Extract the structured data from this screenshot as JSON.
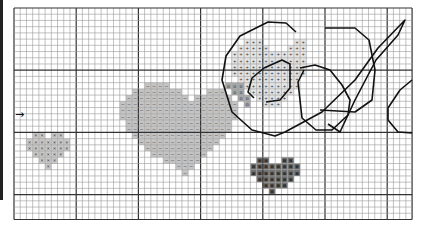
{
  "pattern": {
    "title": "cross-stitch chart",
    "grid": {
      "origin_x": 14,
      "origin_y": 8,
      "cell": 6.22,
      "cols": 64,
      "rows": 34,
      "major_every": 10,
      "minor_color": "#9a9a9a",
      "major_color": "#333333"
    },
    "start_marker": {
      "symbol": "→",
      "row": 17
    },
    "regions": [
      {
        "name": "small-x-heart",
        "symbol": "×",
        "fill": "#c8c8c8",
        "rows": [
          [
            20,
            [
              3,
              4,
              6,
              7
            ]
          ],
          [
            21,
            [
              2,
              3,
              4,
              5,
              6,
              7,
              8
            ]
          ],
          [
            22,
            [
              2,
              3,
              4,
              5,
              6,
              7,
              8
            ]
          ],
          [
            23,
            [
              3,
              4,
              5,
              6,
              7
            ]
          ],
          [
            24,
            [
              4,
              5,
              6
            ]
          ],
          [
            25,
            [
              5
            ]
          ]
        ]
      },
      {
        "name": "large-dash-heart",
        "symbol": "–",
        "fill": "#c4c4c4",
        "rows": [
          [
            12,
            [
              21,
              22,
              23,
              24
            ]
          ],
          [
            13,
            [
              19,
              20,
              21,
              22,
              23,
              24,
              25,
              26,
              31,
              32,
              33
            ]
          ],
          [
            14,
            [
              18,
              19,
              20,
              21,
              22,
              23,
              24,
              25,
              26,
              27,
              29,
              30,
              31,
              32,
              33,
              34
            ]
          ],
          [
            15,
            [
              17,
              18,
              19,
              20,
              21,
              22,
              23,
              24,
              25,
              26,
              27,
              28,
              29,
              30,
              31,
              32,
              33,
              34,
              35
            ]
          ],
          [
            16,
            [
              17,
              18,
              19,
              20,
              21,
              22,
              23,
              24,
              25,
              26,
              27,
              28,
              29,
              30,
              31,
              32,
              33,
              34,
              35
            ]
          ],
          [
            17,
            [
              17,
              18,
              19,
              20,
              21,
              22,
              23,
              24,
              25,
              26,
              27,
              28,
              29,
              30,
              31,
              32,
              33,
              34,
              35
            ]
          ],
          [
            18,
            [
              18,
              19,
              20,
              21,
              22,
              23,
              24,
              25,
              26,
              27,
              28,
              29,
              30,
              31,
              32,
              33,
              34
            ]
          ],
          [
            19,
            [
              18,
              19,
              20,
              21,
              22,
              23,
              24,
              25,
              26,
              27,
              28,
              29,
              30,
              31,
              32,
              33,
              34
            ]
          ],
          [
            20,
            [
              19,
              20,
              21,
              22,
              23,
              24,
              25,
              26,
              27,
              28,
              29,
              30,
              31,
              32,
              33
            ]
          ],
          [
            21,
            [
              20,
              21,
              22,
              23,
              24,
              25,
              26,
              27,
              28,
              29,
              30,
              31,
              32
            ]
          ],
          [
            22,
            [
              21,
              22,
              23,
              24,
              25,
              26,
              27,
              28,
              29,
              30,
              31
            ]
          ],
          [
            23,
            [
              22,
              23,
              24,
              25,
              26,
              27,
              28,
              29,
              30
            ]
          ],
          [
            24,
            [
              24,
              25,
              26,
              27,
              28,
              29
            ]
          ],
          [
            25,
            [
              26,
              27,
              28
            ]
          ],
          [
            26,
            [
              27
            ]
          ]
        ]
      },
      {
        "name": "plus-region",
        "symbol": "+",
        "fill": "#e4e4e4",
        "rows": [
          [
            5,
            [
              37,
              38,
              39,
              45,
              46
            ]
          ],
          [
            6,
            [
              36,
              37,
              38,
              39,
              40,
              44,
              45,
              46
            ]
          ],
          [
            7,
            [
              35,
              36,
              37,
              38,
              39,
              40,
              41,
              42,
              43,
              44,
              45,
              46
            ]
          ],
          [
            8,
            [
              35,
              36,
              37,
              38,
              39,
              40,
              41,
              42,
              43,
              44,
              45,
              46
            ]
          ],
          [
            9,
            [
              35,
              36,
              37,
              38,
              39,
              40,
              41,
              42,
              43,
              44,
              45,
              46
            ]
          ],
          [
            10,
            [
              35,
              36,
              37,
              38,
              39,
              40,
              41,
              42,
              43,
              44,
              45,
              46
            ]
          ],
          [
            11,
            [
              36,
              37,
              38,
              39,
              40,
              41,
              42,
              43,
              44,
              45
            ]
          ],
          [
            12,
            [
              37,
              38,
              39,
              40,
              41,
              42,
              43,
              44,
              45
            ]
          ],
          [
            13,
            [
              38,
              39,
              40,
              41,
              42,
              43,
              44
            ]
          ],
          [
            14,
            [
              39,
              40,
              41,
              42,
              43
            ]
          ],
          [
            15,
            [
              40,
              41,
              42
            ]
          ]
        ]
      },
      {
        "name": "o-region",
        "symbol": "o",
        "fill": "#a8a8a8",
        "rows": [
          [
            12,
            [
              34,
              35,
              36
            ]
          ],
          [
            13,
            [
              35,
              36
            ]
          ],
          [
            14,
            [
              36,
              37
            ]
          ],
          [
            15,
            [
              37
            ]
          ]
        ]
      },
      {
        "name": "black-heart",
        "symbol": "■",
        "fill": "#6e6e6e",
        "rows": [
          [
            24,
            [
              39,
              40,
              43,
              44
            ]
          ],
          [
            25,
            [
              38,
              39,
              40,
              41,
              42,
              43,
              44,
              45
            ]
          ],
          [
            26,
            [
              38,
              39,
              40,
              41,
              42,
              43,
              44,
              45
            ]
          ],
          [
            27,
            [
              39,
              40,
              41,
              42,
              43,
              44
            ]
          ],
          [
            28,
            [
              40,
              41,
              42,
              43
            ]
          ],
          [
            29,
            [
              41
            ]
          ]
        ]
      }
    ],
    "outlines": [
      {
        "name": "large-ring-outer",
        "points": [
          [
            296,
            32
          ],
          [
            286,
            23
          ],
          [
            268,
            22
          ],
          [
            240,
            36
          ],
          [
            226,
            56
          ],
          [
            222,
            80
          ],
          [
            232,
            112
          ],
          [
            252,
            130
          ],
          [
            275,
            136
          ],
          [
            285,
            132
          ]
        ]
      },
      {
        "name": "large-ring-inner",
        "points": [
          [
            254,
            98
          ],
          [
            248,
            92
          ],
          [
            252,
            78
          ],
          [
            264,
            68
          ],
          [
            282,
            60
          ],
          [
            290,
            64
          ],
          [
            290,
            88
          ],
          [
            280,
            100
          ],
          [
            266,
            102
          ]
        ]
      },
      {
        "name": "ring-loop",
        "points": [
          [
            300,
            68
          ],
          [
            315,
            65
          ],
          [
            330,
            70
          ],
          [
            342,
            85
          ],
          [
            350,
            100
          ],
          [
            348,
            115
          ],
          [
            332,
            130
          ],
          [
            316,
            130
          ],
          [
            302,
            118
          ],
          [
            300,
            100
          ],
          [
            298,
            82
          ],
          [
            304,
            70
          ]
        ]
      },
      {
        "name": "swoosh",
        "points": [
          [
            285,
            132
          ],
          [
            322,
            112
          ],
          [
            355,
            80
          ],
          [
            378,
            48
          ],
          [
            405,
            20
          ],
          [
            398,
            35
          ],
          [
            376,
            60
          ],
          [
            355,
            100
          ],
          [
            340,
            132
          ],
          [
            328,
            124
          ]
        ]
      },
      {
        "name": "big-octagon",
        "points": [
          [
            325,
            28
          ],
          [
            355,
            28
          ],
          [
            369,
            40
          ],
          [
            375,
            70
          ],
          [
            372,
            100
          ],
          [
            355,
            112
          ],
          [
            320,
            110
          ]
        ]
      },
      {
        "name": "right-octagon",
        "points": [
          [
            412,
            80
          ],
          [
            400,
            90
          ],
          [
            388,
            108
          ],
          [
            388,
            120
          ],
          [
            398,
            132
          ],
          [
            412,
            133
          ]
        ]
      }
    ]
  }
}
